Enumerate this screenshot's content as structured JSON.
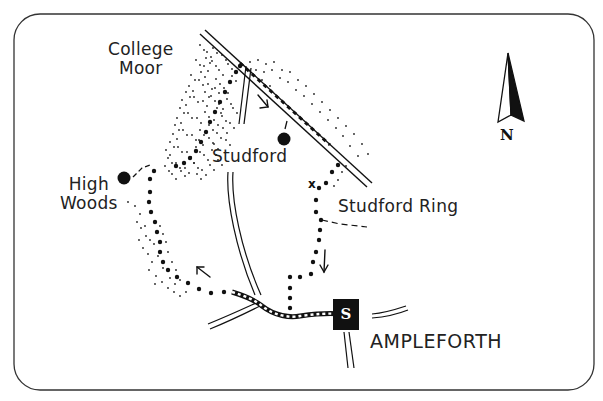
{
  "map": {
    "places": {
      "college_moor": {
        "line1": "College",
        "line2": "Moor"
      },
      "high_woods": {
        "line1": "High",
        "line2": "Woods"
      },
      "studford": "Studford",
      "studford_ring": "Studford Ring",
      "ampleforth": "AMPLEFORTH"
    },
    "markers": {
      "start": "S",
      "cross": "x",
      "north": "N"
    },
    "icons": {
      "north-arrow-icon": "compass north arrow",
      "start-marker-icon": "black square with S",
      "point-of-interest-icon": "black filled circle",
      "direction-arrow-icon": "walking direction arrow"
    },
    "colors": {
      "ink": "#111111",
      "paper": "#ffffff",
      "frame": "#333333"
    }
  }
}
